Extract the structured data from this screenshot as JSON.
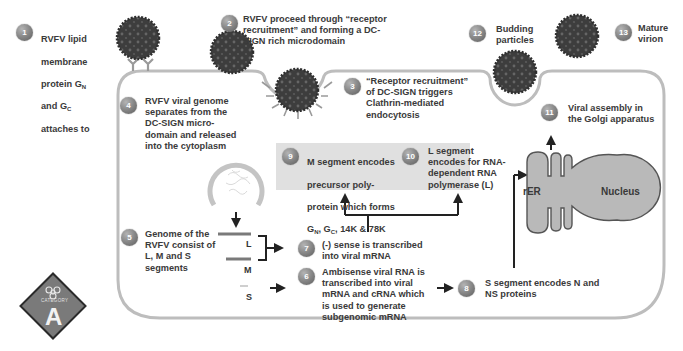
{
  "steps": [
    {
      "num": "1",
      "text": "RVFV lipid\nmembrane\nprotein G_N\nand G_C\nattaches to"
    },
    {
      "num": "2",
      "text": "RVFV proceed through “receptor\nrecruitment” and forming a DC-\nSIGN rich microdomain"
    },
    {
      "num": "3",
      "text": "“Receptor recruitment”\nof DC-SIGN triggers\nClathrin-mediated\nendocytosis"
    },
    {
      "num": "4",
      "text": "RVFV viral genome\nseparates from the\nDC-SIGN micro-\ndomain and released\ninto the cytoplasm"
    },
    {
      "num": "5",
      "text": "Genome of the\nRVFV consist of\nL, M and S\nsegments"
    },
    {
      "num": "6",
      "text": "Ambisense viral RNA is\ntranscribed into viral\nmRNA and cRNA which\nis used to generate\nsubgenomic mRNA"
    },
    {
      "num": "7",
      "text": "(-) sense is transcribed\ninto viral mRNA"
    },
    {
      "num": "8",
      "text": "S segment encodes N and\nNS proteins"
    },
    {
      "num": "9",
      "line1": "M segment encodes",
      "line2": "precursor poly-",
      "line3": "protein which forms",
      "line4_a": "G",
      "line4_sub_a": "N",
      "line4_b": ", G",
      "line4_sub_b": "C",
      "line4_c": ", 14K & 78K"
    },
    {
      "num": "10",
      "text": "L segment\nencodes for RNA-\ndependent RNA\npolymerase (L)"
    },
    {
      "num": "11",
      "text": "Viral assembly in\nthe Golgi apparatus"
    },
    {
      "num": "12",
      "text": "Budding\nparticles"
    },
    {
      "num": "13",
      "text": "Mature\nvirion"
    }
  ],
  "step1_parts": {
    "a": "RVFV lipid",
    "b": "membrane",
    "c_pre": "protein G",
    "c_sub": "N",
    "d_pre": "and G",
    "d_sub": "C",
    "e": "attaches to"
  },
  "segments": {
    "L": "L",
    "M": "M",
    "S": "S"
  },
  "organelles": {
    "rer": "rER",
    "nucleus": "Nucleus"
  },
  "hazard_badge": {
    "category_label": "CATEGORY",
    "letter": "A",
    "icon": "biohazard-icon"
  },
  "colors": {
    "membrane": "#bdbdbd",
    "virion": "#3d3d3d",
    "virion_spot": "#6e6e6e",
    "badge": "#8a8a8a",
    "highlight_box": "#e0e0e0",
    "organelle_fill": "#b9b9b9",
    "organelle_stroke": "#555555",
    "hazard_fill": "#7a7a7a",
    "text": "#3a3a3a"
  }
}
